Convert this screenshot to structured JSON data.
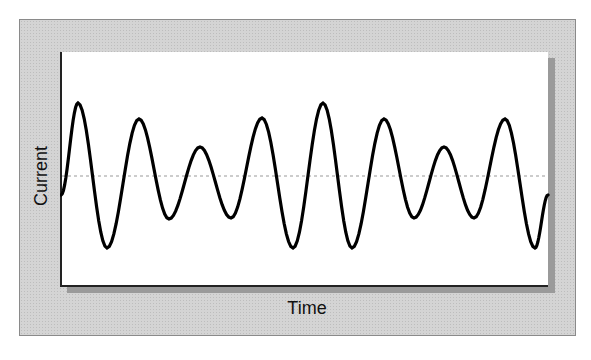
{
  "diagram": {
    "x_axis_label": "Time",
    "y_axis_label": "Current",
    "colors": {
      "frame": "#d4d4d4",
      "plot_background": "#ffffff",
      "waveform": "#000000",
      "baseline": "#999999"
    },
    "baseline_y": 176,
    "waveform_extrema": [
      [
        61,
        195
      ],
      [
        78,
        103
      ],
      [
        107,
        248
      ],
      [
        139,
        119
      ],
      [
        169,
        219
      ],
      [
        200,
        147
      ],
      [
        231,
        218
      ],
      [
        262,
        118
      ],
      [
        293,
        248
      ],
      [
        323,
        103
      ],
      [
        352,
        248
      ],
      [
        384,
        119
      ],
      [
        414,
        218
      ],
      [
        444,
        147
      ],
      [
        474,
        218
      ],
      [
        505,
        119
      ],
      [
        535,
        248
      ],
      [
        548,
        195
      ]
    ]
  }
}
